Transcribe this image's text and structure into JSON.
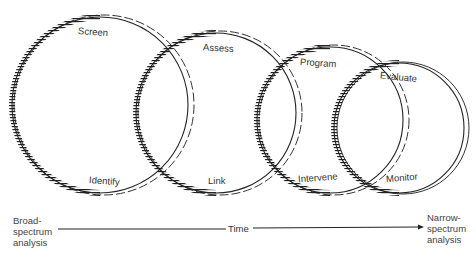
{
  "diagram": {
    "circles": [
      {
        "id": "c1",
        "top_label": "Screen",
        "bottom_label": "Identify"
      },
      {
        "id": "c2",
        "top_label": "Assess",
        "bottom_label": "Link"
      },
      {
        "id": "c3",
        "top_label": "Program",
        "bottom_label": "Intervene"
      },
      {
        "id": "c4",
        "top_label": "Evaluate",
        "bottom_label": "Monitor"
      }
    ],
    "axis": {
      "left_label_lines": [
        "Broad-",
        "spectrum",
        "analysis"
      ],
      "center_label": "Time",
      "right_label_lines": [
        "Narrow-",
        "spectrum",
        "analysis"
      ]
    }
  }
}
